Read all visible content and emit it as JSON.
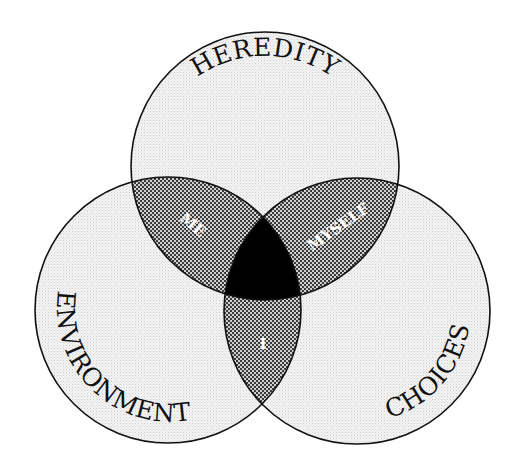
{
  "diagram": {
    "type": "venn",
    "sets": [
      {
        "id": "heredity",
        "label": "HEREDITY",
        "position": "top"
      },
      {
        "id": "environment",
        "label": "ENVIRONMENT",
        "position": "bottom-left"
      },
      {
        "id": "choices",
        "label": "CHOICES",
        "position": "bottom-right"
      }
    ],
    "intersections": [
      {
        "sets": [
          "heredity",
          "environment"
        ],
        "label": "ME"
      },
      {
        "sets": [
          "heredity",
          "choices"
        ],
        "label": "MYSELF"
      },
      {
        "sets": [
          "environment",
          "choices"
        ],
        "label": "I"
      },
      {
        "sets": [
          "heredity",
          "environment",
          "choices"
        ],
        "label": ""
      }
    ],
    "colors": {
      "single_region_fill": "#ececec",
      "pair_overlap_fill": "#8c8c8c",
      "triple_overlap_fill": "#000000",
      "outline": "#111111",
      "overlap_text": "#ffffff"
    }
  }
}
